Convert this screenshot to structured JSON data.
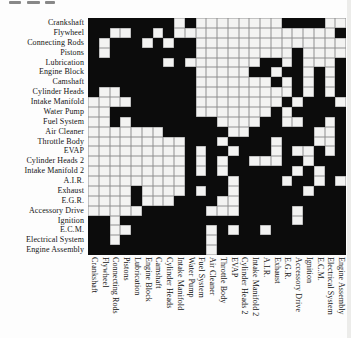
{
  "figure": {
    "kind": "design-structure-matrix",
    "component_count": 24
  },
  "colors": {
    "filled_cell": "#0c0c0c",
    "empty_cell": "#f3f3f2",
    "grid_line": "#8f8f8f",
    "background": "#fdfdfd"
  },
  "chart_data": {
    "type": "heatmap",
    "title": "",
    "xlabel": "",
    "ylabel": "",
    "legend_position": "none",
    "grid": true,
    "row_labels": [
      "Crankshaft",
      "Flywheel",
      "Connecting Rods",
      "Pistons",
      "Lubrication",
      "Engine Block",
      "Camshaft",
      "Cylinder Heads",
      "Intake Manifold",
      "Water Pump",
      "Fuel System",
      "Air Cleaner",
      "Throttle Body",
      "EVAP",
      "Cylinder Heads 2",
      "Intake Manifold 2",
      "A.I.R.",
      "Exhaust",
      "E.G.R.",
      "Accessory Drive",
      "Ignition",
      "E.C.M.",
      "Electrical System",
      "Engine Assembly"
    ],
    "col_labels": [
      "Crankshaft",
      "Flywheel",
      "Connecting Rods",
      "Pistons",
      "Lubrication",
      "Engine Block",
      "Camshaft",
      "Cylinder Heads",
      "Intake Manifold",
      "Water Pump",
      "Fuel System",
      "Air Cleaner",
      "Throttle Body",
      "EVAP",
      "Cylinder Heads 2",
      "Intake Manifold 2",
      "A.I.R.",
      "Exhaust",
      "E.G.R.",
      "Accessory Drive",
      "Ignition",
      "E.C.M.",
      "Electrical System",
      "Engine Assembly"
    ],
    "value_encoding": {
      "1": "filled (dependency)",
      "0": "empty"
    },
    "matrix": [
      "111111110100000000111100",
      "110011010000000000000001",
      "101110101100000000000000",
      "101111111100000000010000",
      "111111101000000011010001",
      "111111111100000110110101",
      "111111111100000001010101",
      "100111111100000000010101",
      "000011111100000000101110",
      "001111111100000001011111",
      "001011111111000011001101",
      "000000011111100111111001",
      "000000000111011110111001",
      "000000000101101110100101",
      "000000000101011000110111",
      "000000000101011111101011",
      "000000000111101111011010",
      "000010000101101111110111",
      "000010001111001111111111",
      "000001111110001111101111",
      "110111111111111111101111",
      "110011111110101101111111",
      "110111111110111111111111",
      "111111111110111111111111"
    ]
  }
}
